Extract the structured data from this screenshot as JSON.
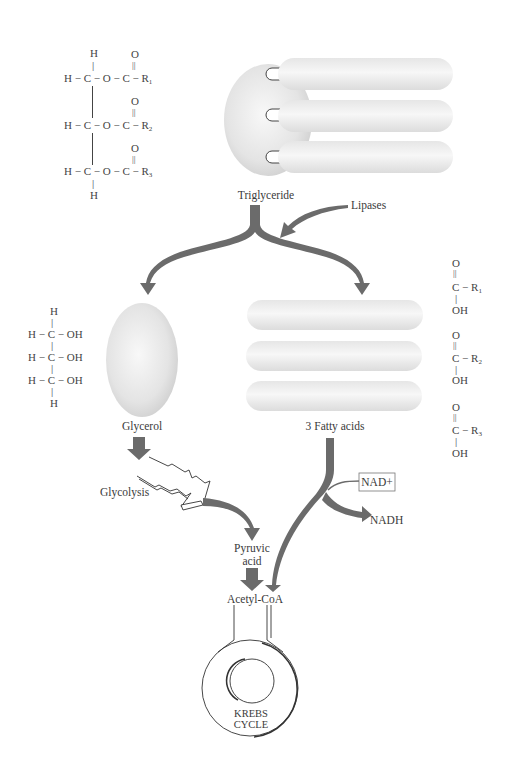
{
  "diagram": {
    "colors": {
      "arrow": "#6b6b6b",
      "shape_fill": "#e6e6e6",
      "shape_light": "#f6f6f6",
      "line": "#333333",
      "text": "#3a3a3a"
    },
    "triglyceride_formula": {
      "rows": [
        {
          "top": "H",
          "left": "H",
          "carbon": "C",
          "link": "O",
          "carbonyl_O": "O",
          "carbonyl_C": "C",
          "r": "R",
          "r_sub": "1"
        },
        {
          "left": "H",
          "carbon": "C",
          "link": "O",
          "carbonyl_O": "O",
          "carbonyl_C": "C",
          "r": "R",
          "r_sub": "2"
        },
        {
          "left": "H",
          "carbon": "C",
          "link": "O",
          "carbonyl_O": "O",
          "carbonyl_C": "C",
          "r": "R",
          "r_sub": "3",
          "bottom": "H"
        }
      ]
    },
    "glycerol_formula": {
      "top": "H",
      "rows": [
        {
          "left": "H",
          "carbon": "C",
          "group": "OH"
        },
        {
          "left": "H",
          "carbon": "C",
          "group": "OH"
        },
        {
          "left": "H",
          "carbon": "C",
          "group": "OH"
        }
      ],
      "bottom": "H"
    },
    "fatty_acid_formulas": [
      {
        "o": "O",
        "c": "C",
        "r": "R",
        "r_sub": "1",
        "oh": "OH"
      },
      {
        "o": "O",
        "c": "C",
        "r": "R",
        "r_sub": "2",
        "oh": "OH"
      },
      {
        "o": "O",
        "c": "C",
        "r": "R",
        "r_sub": "3",
        "oh": "OH"
      }
    ],
    "labels": {
      "triglyceride": "Triglyceride",
      "lipases": "Lipases",
      "glycerol": "Glycerol",
      "fatty_acids": "3 Fatty acids",
      "glycolysis": "Glycolysis",
      "nad_plus": "NAD+",
      "nadh": "NADH",
      "pyruvic": "Pyruvic",
      "acid": "acid",
      "acetyl_coa": "Acetyl-CoA",
      "krebs": "KREBS",
      "cycle": "CYCLE"
    },
    "nodes": [
      {
        "id": "triglyceride",
        "type": "molecule"
      },
      {
        "id": "lipases",
        "type": "enzyme"
      },
      {
        "id": "glycerol",
        "type": "molecule"
      },
      {
        "id": "fatty_acids",
        "type": "molecule",
        "count": 3
      },
      {
        "id": "glycolysis",
        "type": "pathway"
      },
      {
        "id": "pyruvic_acid",
        "type": "molecule"
      },
      {
        "id": "nad_plus",
        "type": "cofactor"
      },
      {
        "id": "nadh",
        "type": "cofactor"
      },
      {
        "id": "acetyl_coa",
        "type": "molecule"
      },
      {
        "id": "krebs_cycle",
        "type": "pathway"
      }
    ],
    "edges": [
      {
        "from": "lipases",
        "to": "triglyceride"
      },
      {
        "from": "triglyceride",
        "to": "glycerol"
      },
      {
        "from": "triglyceride",
        "to": "fatty_acids"
      },
      {
        "from": "glycerol",
        "to": "glycolysis"
      },
      {
        "from": "glycolysis",
        "to": "pyruvic_acid"
      },
      {
        "from": "pyruvic_acid",
        "to": "acetyl_coa"
      },
      {
        "from": "fatty_acids",
        "to": "acetyl_coa"
      },
      {
        "from": "nad_plus",
        "to": "nadh"
      },
      {
        "from": "acetyl_coa",
        "to": "krebs_cycle"
      }
    ]
  }
}
